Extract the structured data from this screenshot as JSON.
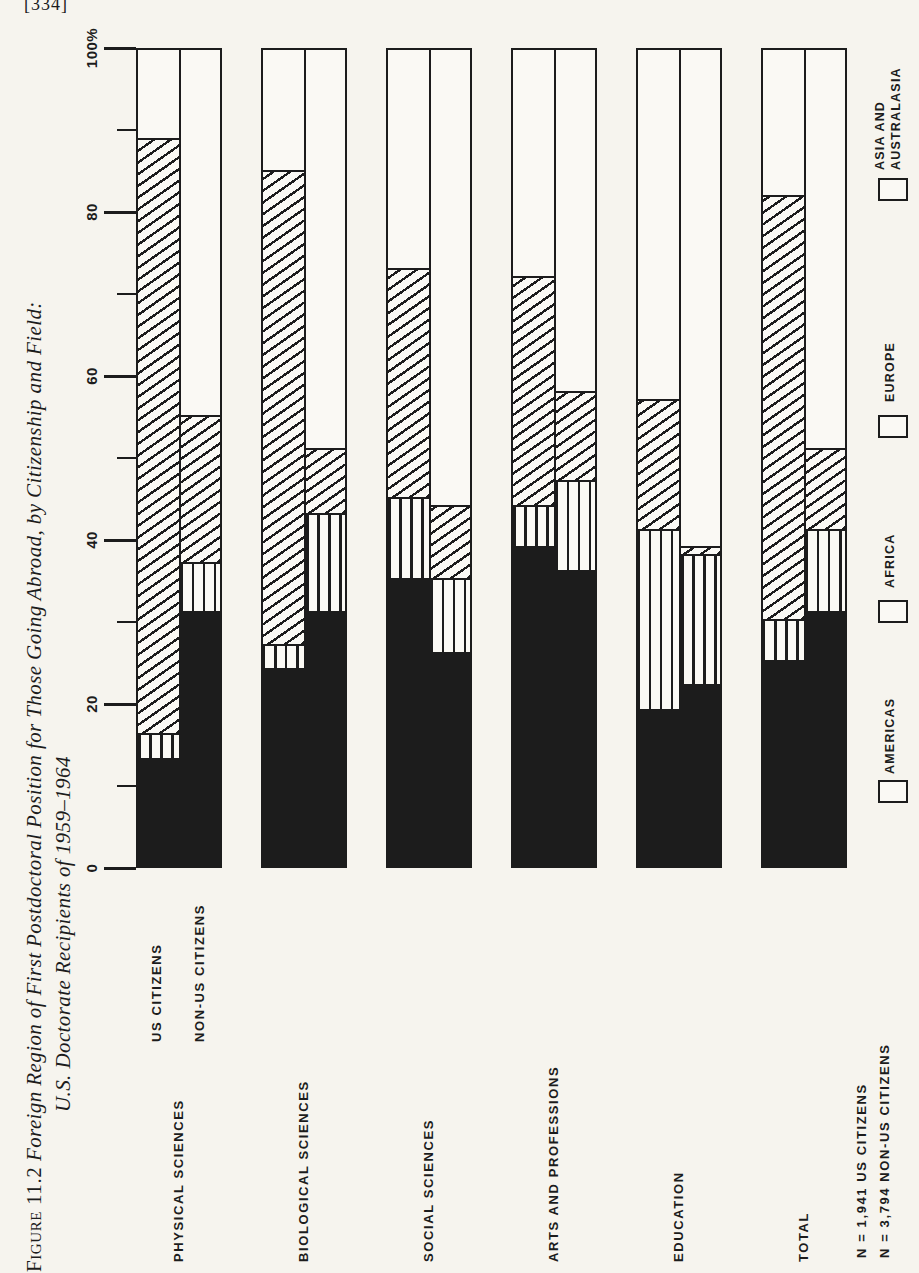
{
  "page": {
    "number": "[334]",
    "paper_color": "#f6f4ee",
    "ink_color": "#1c1c1c"
  },
  "title": {
    "line1_prefix": "Figure 11.2",
    "line1_rest": " Foreign Region of First Postdoctoral Position for Those Going Abroad, by Citizenship and Field:",
    "line2": "U.S. Doctorate Recipients of 1959–1964"
  },
  "chart_data": {
    "type": "bar",
    "stacked": true,
    "unit": "percent of doctorate recipients going abroad",
    "note_orientation": "figure is printed rotated 90° on the page; all chart text reads bottom-to-top",
    "axis": {
      "min": 0,
      "max": 100,
      "major_ticks": [
        0,
        20,
        40,
        60,
        80,
        100
      ],
      "minor_ticks": [
        10,
        30,
        50,
        70,
        90
      ],
      "tick_labels": [
        "0",
        "20",
        "40",
        "60",
        "80",
        "100%"
      ]
    },
    "series_labels": [
      "US CITIZENS",
      "NON-US CITIZENS"
    ],
    "segment_labels_bottom_to_top": [
      "AMERICAS",
      "AFRICA",
      "EUROPE",
      "ASIA AND AUSTRALASIA"
    ],
    "groups": [
      {
        "label": "PHYSICAL SCIENCES",
        "us": [
          13,
          3,
          73,
          11
        ],
        "non_us": [
          31,
          6,
          18,
          45
        ]
      },
      {
        "label": "BIOLOGICAL SCIENCES",
        "us": [
          24,
          3,
          58,
          15
        ],
        "non_us": [
          31,
          12,
          8,
          49
        ]
      },
      {
        "label": "SOCIAL SCIENCES",
        "us": [
          35,
          10,
          28,
          27
        ],
        "non_us": [
          26,
          9,
          9,
          56
        ]
      },
      {
        "label": "ARTS AND PROFESSIONS",
        "us": [
          39,
          5,
          28,
          28
        ],
        "non_us": [
          36,
          11,
          11,
          42
        ]
      },
      {
        "label": "EDUCATION",
        "us": [
          19,
          22,
          16,
          43
        ],
        "non_us": [
          22,
          16,
          1,
          61
        ]
      },
      {
        "label": "TOTAL",
        "us": [
          25,
          5,
          52,
          18
        ],
        "non_us": [
          31,
          10,
          10,
          49
        ]
      }
    ],
    "legend": [
      {
        "label": "ASIA AND AUSTRALASIA",
        "lines": [
          "ASIA AND",
          "AUSTRALASIA"
        ],
        "pattern": "plain"
      },
      {
        "label": "EUROPE",
        "lines": [
          "EUROPE"
        ],
        "pattern": "hatch"
      },
      {
        "label": "AFRICA",
        "lines": [
          "AFRICA"
        ],
        "pattern": "vstripes"
      },
      {
        "label": "AMERICAS",
        "lines": [
          "AMERICAS"
        ],
        "pattern": "solid"
      }
    ],
    "sample_sizes": [
      "N = 1,941 US CITIZENS",
      "N = 3,794 NON-US CITIZENS"
    ]
  }
}
